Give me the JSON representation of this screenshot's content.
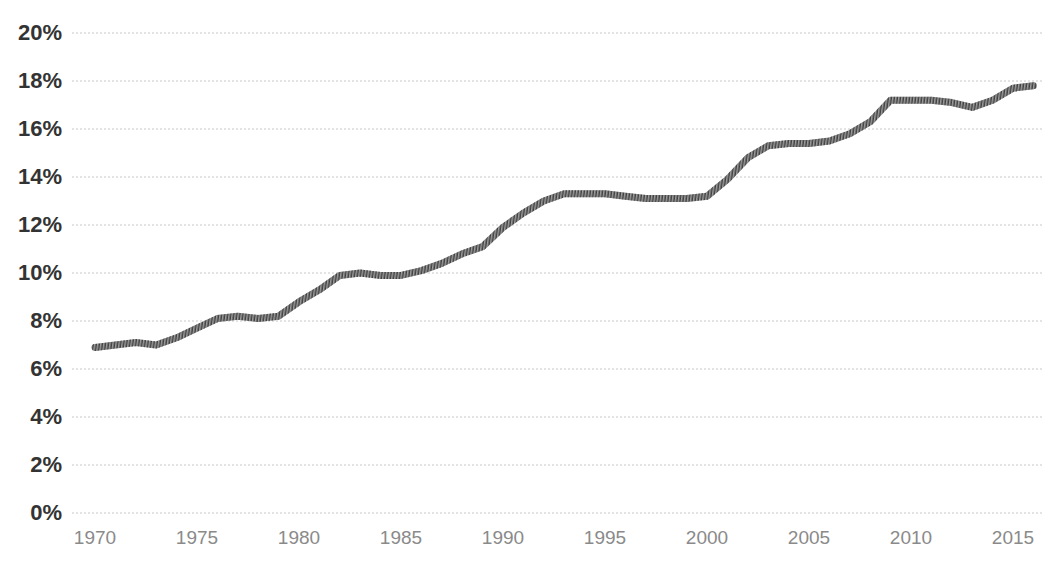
{
  "chart_data": {
    "type": "line",
    "title": "",
    "subtitle": "",
    "xlabel": "",
    "ylabel": "",
    "xlim": [
      1970,
      2016
    ],
    "ylim": [
      0,
      20
    ],
    "grid": true,
    "legend": null,
    "legend_position": "none",
    "y_tick_labels": [
      "20%",
      "18%",
      "16%",
      "14%",
      "12%",
      "10%",
      "8%",
      "6%",
      "4%",
      "2%",
      "0%"
    ],
    "y_tick_values": [
      20,
      18,
      16,
      14,
      12,
      10,
      8,
      6,
      4,
      2,
      0
    ],
    "x_tick_labels": [
      "1970",
      "1975",
      "1980",
      "1985",
      "1990",
      "1995",
      "2000",
      "2005",
      "2010",
      "2015"
    ],
    "x_tick_values": [
      1970,
      1975,
      1980,
      1985,
      1990,
      1995,
      2000,
      2005,
      2010,
      2015
    ],
    "value_suffix": "%",
    "series": [
      {
        "name": "",
        "color": "#404040",
        "x": [
          1970,
          1971,
          1972,
          1973,
          1974,
          1975,
          1976,
          1977,
          1978,
          1979,
          1980,
          1981,
          1982,
          1983,
          1984,
          1985,
          1986,
          1987,
          1988,
          1989,
          1990,
          1991,
          1992,
          1993,
          1994,
          1995,
          1996,
          1997,
          1998,
          1999,
          2000,
          2001,
          2002,
          2003,
          2004,
          2005,
          2006,
          2007,
          2008,
          2009,
          2010,
          2011,
          2012,
          2013,
          2014,
          2015,
          2016
        ],
        "values": [
          6.9,
          7.0,
          7.1,
          7.0,
          7.3,
          7.7,
          8.1,
          8.2,
          8.1,
          8.2,
          8.8,
          9.3,
          9.9,
          10.0,
          9.9,
          9.9,
          10.1,
          10.4,
          10.8,
          11.1,
          11.9,
          12.5,
          13.0,
          13.3,
          13.3,
          13.3,
          13.2,
          13.1,
          13.1,
          13.1,
          13.2,
          13.9,
          14.8,
          15.3,
          15.4,
          15.4,
          15.5,
          15.8,
          16.3,
          17.2,
          17.2,
          17.2,
          17.1,
          16.9,
          17.2,
          17.7,
          17.8
        ]
      }
    ],
    "axis_colors": {
      "gridline": "#c8c8c8",
      "y_label_text": "#333333",
      "x_label_text": "#8a8a8a",
      "line": "#404040",
      "background": "#ffffff"
    },
    "geometry": {
      "plot_left": 72,
      "plot_right": 1042,
      "y_zero_px": 513,
      "y_max_px": 33,
      "x_1970_px": 95,
      "px_per_year": 20.4
    }
  }
}
